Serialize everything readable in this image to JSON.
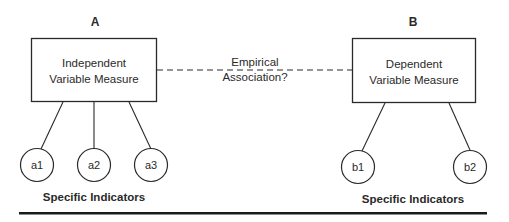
{
  "diagram": {
    "left": {
      "header": "A",
      "box_lines": [
        "Independent",
        "Variable Measure"
      ],
      "indicators": [
        "a1",
        "a2",
        "a3"
      ],
      "indicators_label": "Specific Indicators"
    },
    "right": {
      "header": "B",
      "box_lines": [
        "Dependent",
        "Variable Measure"
      ],
      "indicators": [
        "b1",
        "b2"
      ],
      "indicators_label": "Specific Indicators"
    },
    "link": {
      "style": "dashed",
      "label_lines": [
        "Empirical",
        "Association?"
      ]
    }
  },
  "colors": {
    "stroke": "#2a2a2a",
    "background": "#ffffff"
  }
}
